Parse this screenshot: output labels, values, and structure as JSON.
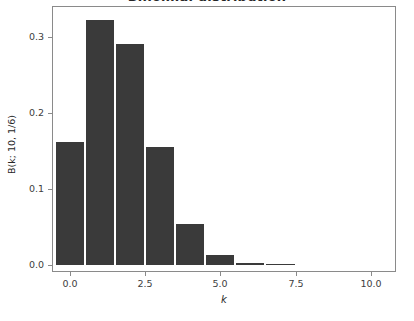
{
  "chart_data": {
    "type": "bar",
    "title": "Binomial distribution",
    "xlabel": "k",
    "ylabel": "B(k; 10, 1/6)",
    "categories": [
      "0",
      "1",
      "2",
      "3",
      "4",
      "5",
      "6",
      "7"
    ],
    "x": [
      0,
      1,
      2,
      3,
      4,
      5,
      6,
      7
    ],
    "values": [
      0.1615,
      0.323,
      0.2907,
      0.155,
      0.0543,
      0.013,
      0.0022,
      0.0002
    ],
    "xlim": [
      -0.55,
      10.8
    ],
    "ylim": [
      -0.008,
      0.3395
    ],
    "xticks": [
      0.0,
      2.5,
      5.0,
      7.5,
      10.0
    ],
    "xtick_labels": [
      "0.0",
      "2.5",
      "5.0",
      "7.5",
      "10.0"
    ],
    "yticks": [
      0.0,
      0.1,
      0.2,
      0.3
    ],
    "ytick_labels": [
      "0.0",
      "0.1",
      "0.2",
      "0.3"
    ],
    "grid": false,
    "legend": false,
    "bar_color": "#3a3a3a",
    "background_color": "#ffffff",
    "axis_color": "#8a8a8a",
    "bar_width": 0.93
  }
}
